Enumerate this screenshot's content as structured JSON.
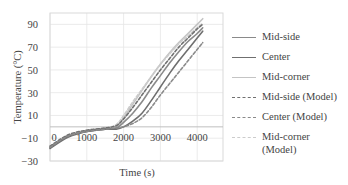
{
  "chart_data": {
    "type": "line",
    "title": "",
    "xlabel": "Time (s)",
    "ylabel": "Temperature (°C)",
    "xlim": [
      0,
      4700
    ],
    "ylim": [
      -30,
      100
    ],
    "xticks": [
      0,
      1000,
      2000,
      3000,
      4000
    ],
    "xtick_labels": [
      "0",
      "1000",
      "2000",
      "3000",
      "4000"
    ],
    "yticks": [
      -30,
      -10,
      10,
      30,
      50,
      70,
      90
    ],
    "ytick_labels": [
      "−30",
      "−10",
      "10",
      "30",
      "50",
      "70",
      "90"
    ],
    "grid": true,
    "legend_position": "right",
    "series": [
      {
        "name": "Mid-side",
        "style": "solid",
        "color": "#8a8a8a",
        "x": [
          0,
          500,
          1000,
          1500,
          1800,
          2000,
          2250,
          2500,
          2750,
          3000,
          3250,
          3500,
          3750,
          4000,
          4150
        ],
        "y": [
          -18,
          -8,
          -4,
          -2,
          -1,
          4,
          12,
          22,
          34,
          45,
          56,
          66,
          75,
          82,
          87
        ]
      },
      {
        "name": "Center",
        "style": "solid",
        "color": "#6f6f6f",
        "x": [
          0,
          500,
          1000,
          1500,
          1800,
          2000,
          2250,
          2500,
          2750,
          3000,
          3250,
          3500,
          3750,
          4000,
          4150
        ],
        "y": [
          -19,
          -9,
          -4,
          -2,
          -2,
          0,
          5,
          12,
          23,
          35,
          47,
          58,
          68,
          78,
          84
        ]
      },
      {
        "name": "Mid-corner",
        "style": "solid",
        "color": "#c4c4c4",
        "x": [
          0,
          500,
          1000,
          1500,
          1800,
          2000,
          2250,
          2500,
          2750,
          3000,
          3250,
          3500,
          3750,
          4000,
          4150
        ],
        "y": [
          -18,
          -8,
          -4,
          -2,
          0,
          8,
          20,
          32,
          44,
          55,
          65,
          74,
          82,
          90,
          95
        ]
      },
      {
        "name": "Mid-side (Model)",
        "style": "dashed",
        "color": "#707070",
        "x": [
          0,
          500,
          1000,
          1500,
          1800,
          2000,
          2250,
          2500,
          2750,
          3000,
          3250,
          3500,
          3750,
          4000,
          4150
        ],
        "y": [
          -17,
          -7,
          -3,
          -1,
          1,
          7,
          17,
          28,
          39,
          50,
          60,
          70,
          78,
          86,
          90
        ]
      },
      {
        "name": "Center (Model)",
        "style": "dashed",
        "color": "#8a8a8a",
        "x": [
          0,
          500,
          1000,
          1500,
          1800,
          2000,
          2250,
          2500,
          2750,
          3000,
          3250,
          3500,
          3750,
          4000,
          4150
        ],
        "y": [
          -18,
          -8,
          -4,
          -2,
          -1,
          0,
          3,
          8,
          17,
          28,
          38,
          48,
          58,
          68,
          74
        ]
      },
      {
        "name": "Mid-corner\n(Model)",
        "style": "dashed",
        "color": "#cccccc",
        "x": [
          0,
          500,
          1000,
          1500,
          1800,
          2000,
          2250,
          2500,
          2750,
          3000,
          3250,
          3500,
          3750,
          4000,
          4150
        ],
        "y": [
          -17,
          -7,
          -3,
          -1,
          2,
          10,
          22,
          33,
          44,
          55,
          64,
          73,
          80,
          87,
          91
        ]
      }
    ]
  },
  "legend": {
    "items": [
      {
        "label": "Mid-side"
      },
      {
        "label": "Center"
      },
      {
        "label": "Mid-corner"
      },
      {
        "label": "Mid-side (Model)"
      },
      {
        "label": "Center (Model)"
      },
      {
        "label": "Mid-corner (Model)"
      }
    ]
  }
}
